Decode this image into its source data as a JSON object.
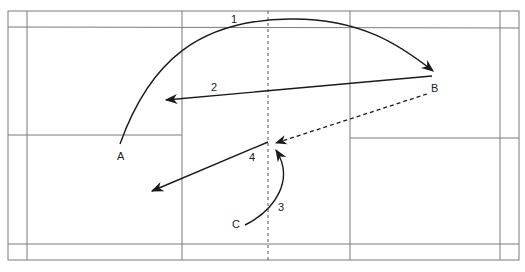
{
  "diagram": {
    "title": "",
    "type": "badminton court play diagram",
    "positions": [
      {
        "id": "A",
        "label": "A"
      },
      {
        "id": "B",
        "label": "B"
      },
      {
        "id": "C",
        "label": "C"
      }
    ],
    "shots": [
      {
        "number": "1",
        "label": "1",
        "from": "A",
        "to": "B",
        "style": "curved-solid"
      },
      {
        "number": "2",
        "label": "2",
        "from": "B",
        "to": "left-back",
        "style": "straight-solid"
      },
      {
        "number": "3",
        "label": "3",
        "from": "C",
        "to": "center",
        "style": "curved-solid"
      },
      {
        "number": "4",
        "label": "4",
        "from": "center",
        "to": "left-mid",
        "style": "straight-solid"
      }
    ],
    "dashed_path": {
      "from": "B",
      "to": "center",
      "style": "dashed"
    },
    "colors": {
      "court_lines": "#7a7a7a",
      "paths": "#1a1a1a",
      "background": "#ffffff"
    }
  }
}
